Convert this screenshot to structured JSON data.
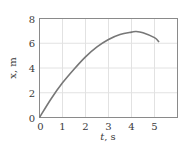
{
  "chart_data": {
    "type": "line",
    "title": "",
    "xlabel": "t, s",
    "ylabel": "x, m",
    "xlim": [
      0,
      6
    ],
    "ylim": [
      0,
      8
    ],
    "xticks": [
      "0",
      "1",
      "2",
      "3",
      "4",
      "5"
    ],
    "yticks": [
      "0",
      "2",
      "4",
      "6",
      "8"
    ],
    "grid": true,
    "legend": null,
    "series": [
      {
        "name": "x(t)",
        "color": "#777777",
        "x": [
          0,
          0.5,
          1,
          1.5,
          2,
          2.5,
          3,
          3.5,
          4,
          4.2,
          4.5,
          5,
          5.2
        ],
        "y": [
          0,
          1.5,
          2.8,
          3.9,
          4.9,
          5.7,
          6.3,
          6.7,
          6.9,
          6.95,
          6.85,
          6.45,
          6.1
        ]
      }
    ]
  },
  "labels": {
    "xlabel_italic": "t",
    "xlabel_unit": ", s",
    "ylabel": "x, m"
  }
}
